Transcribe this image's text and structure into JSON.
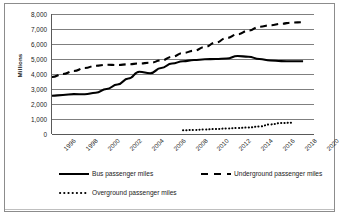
{
  "chart_data": {
    "type": "line",
    "title": "",
    "xlabel": "",
    "ylabel": "Millions",
    "xlim": [
      1996,
      2020
    ],
    "ylim": [
      0,
      8000
    ],
    "grid": true,
    "legend_position": "bottom",
    "y_ticks": [
      "0",
      "1,000",
      "2,000",
      "3,000",
      "4,000",
      "5,000",
      "6,000",
      "7,000",
      "8,000"
    ],
    "y_tick_values": [
      0,
      1000,
      2000,
      3000,
      4000,
      5000,
      6000,
      7000,
      8000
    ],
    "x_ticks": [
      "1996",
      "1998",
      "2000",
      "2002",
      "2004",
      "2006",
      "2008",
      "2010",
      "2012",
      "2014",
      "2016",
      "2018",
      "2020"
    ],
    "x_tick_values": [
      1996,
      1998,
      2000,
      2002,
      2004,
      2006,
      2008,
      2010,
      2012,
      2014,
      2016,
      2018,
      2020
    ],
    "series": [
      {
        "name": "Bus passenger miles",
        "style": "solid",
        "color": "#000000",
        "x": [
          1996,
          1997,
          1998,
          1999,
          2000,
          2001,
          2002,
          2003,
          2004,
          2005,
          2006,
          2007,
          2008,
          2009,
          2010,
          2011,
          2012,
          2013,
          2014,
          2015,
          2016,
          2017,
          2018,
          2019
        ],
        "values": [
          2550,
          2600,
          2660,
          2650,
          2750,
          3000,
          3300,
          3700,
          4150,
          4050,
          4400,
          4700,
          4850,
          4930,
          4980,
          5000,
          5030,
          5200,
          5150,
          5000,
          4900,
          4860,
          4850,
          4850
        ]
      },
      {
        "name": "Underground passenger miles",
        "style": "dashed",
        "color": "#000000",
        "x": [
          1996,
          1997,
          1998,
          1999,
          2000,
          2001,
          2002,
          2003,
          2004,
          2005,
          2006,
          2007,
          2008,
          2009,
          2010,
          2011,
          2012,
          2013,
          2014,
          2015,
          2016,
          2017,
          2018,
          2019
        ],
        "values": [
          3800,
          4000,
          4200,
          4400,
          4550,
          4620,
          4600,
          4650,
          4700,
          4750,
          4900,
          5150,
          5400,
          5550,
          5800,
          6100,
          6400,
          6650,
          6900,
          7150,
          7250,
          7350,
          7430,
          7450
        ]
      },
      {
        "name": "Overground passenger miles",
        "style": "dotted",
        "color": "#000000",
        "x": [
          2008,
          2009,
          2010,
          2011,
          2012,
          2013,
          2014,
          2015,
          2016,
          2017,
          2018
        ],
        "values": [
          250,
          270,
          300,
          330,
          370,
          400,
          430,
          500,
          640,
          730,
          750
        ]
      }
    ]
  },
  "legend": {
    "items": [
      {
        "label": "Bus passenger miles",
        "style": "solid"
      },
      {
        "label": "Underground passenger miles",
        "style": "dashed"
      },
      {
        "label": "Overground passenger miles",
        "style": "dotted"
      }
    ]
  }
}
